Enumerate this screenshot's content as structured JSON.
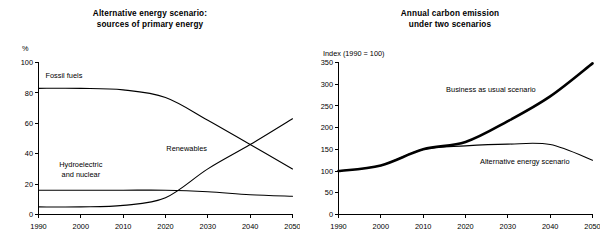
{
  "chart_data": [
    {
      "id": "alternative-energy-sources",
      "type": "line",
      "title_line1": "Alternative energy scenario:",
      "title_line2": "sources of primary energy",
      "xlabel": "",
      "ylabel": "%",
      "ylim": [
        0,
        100
      ],
      "xlim": [
        1990,
        2050
      ],
      "yticks": [
        "0",
        "20",
        "40",
        "60",
        "80",
        "100"
      ],
      "ytick_values": [
        0,
        20,
        40,
        60,
        80,
        100
      ],
      "xticks": [
        "1990",
        "2000",
        "2010",
        "2020",
        "2030",
        "2040",
        "2050"
      ],
      "xtick_values": [
        1990,
        2000,
        2010,
        2020,
        2030,
        2040,
        2050
      ],
      "grid": false,
      "legend_position": "inline-annotations",
      "x": [
        1990,
        2000,
        2010,
        2020,
        2030,
        2040,
        2050
      ],
      "series": [
        {
          "name": "Fossil fuels",
          "label": "Fossil fuels",
          "label_x": 1996,
          "label_y": 90,
          "values": [
            83,
            83,
            82,
            77,
            62,
            46,
            30
          ],
          "style": "thin"
        },
        {
          "name": "Hydroelectric and nuclear",
          "label_line1": "Hydroelectric",
          "label_line2": "and nuclear",
          "label_x": 2000,
          "label_y": 31,
          "values": [
            16,
            16,
            16,
            16,
            15,
            13,
            12
          ],
          "style": "thin"
        },
        {
          "name": "Renewables",
          "label": "Renewables",
          "label_x": 2025,
          "label_y": 42,
          "values": [
            5,
            5,
            6,
            11,
            30,
            46,
            63
          ],
          "style": "thin"
        }
      ]
    },
    {
      "id": "annual-carbon-emission",
      "type": "line",
      "title_line1": "Annual carbon emission",
      "title_line2": "under two scenarios",
      "xlabel": "",
      "ylabel": "Index (1990 = 100)",
      "ylim": [
        0,
        350
      ],
      "xlim": [
        1990,
        2050
      ],
      "yticks": [
        "0",
        "50",
        "100",
        "150",
        "200",
        "250",
        "300",
        "350"
      ],
      "ytick_values": [
        0,
        50,
        100,
        150,
        200,
        250,
        300,
        350
      ],
      "xticks": [
        "1990",
        "2000",
        "2010",
        "2020",
        "2030",
        "2040",
        "2050"
      ],
      "xtick_values": [
        1990,
        2000,
        2010,
        2020,
        2030,
        2040,
        2050
      ],
      "grid": false,
      "legend_position": "inline-annotations",
      "x": [
        1990,
        2000,
        2010,
        2020,
        2030,
        2040,
        2050
      ],
      "series": [
        {
          "name": "Business as usual scenario",
          "label": "Business as usual scenario",
          "label_x": 2026,
          "label_y": 283,
          "values": [
            100,
            113,
            150,
            167,
            215,
            272,
            348
          ],
          "style": "bold"
        },
        {
          "name": "Alternative energy scenario",
          "label": "Alternative energy scenario",
          "label_x": 2034,
          "label_y": 117,
          "values": [
            100,
            113,
            150,
            158,
            162,
            161,
            125
          ],
          "style": "thin"
        }
      ]
    }
  ]
}
